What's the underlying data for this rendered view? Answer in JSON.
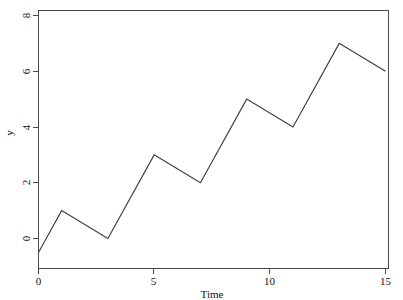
{
  "chart_data": {
    "type": "line",
    "title": "",
    "xlabel": "Time",
    "ylabel": "y",
    "xlim": [
      -0.25,
      15.2
    ],
    "ylim": [
      -0.72,
      8.3
    ],
    "grid": false,
    "legend": "none",
    "x": [
      0,
      1,
      2,
      3,
      4,
      5,
      6,
      7,
      8,
      9,
      10,
      11,
      12,
      13,
      14,
      15
    ],
    "values": [
      -0.5,
      1,
      0.5,
      0,
      1.5,
      3,
      2.5,
      2,
      3.5,
      5,
      4.5,
      4,
      5.5,
      7,
      6.5,
      6
    ],
    "series": [
      {
        "name": "y",
        "values": [
          -0.5,
          1,
          0.5,
          0,
          1.5,
          3,
          2.5,
          2,
          3.5,
          5,
          4.5,
          4,
          5.5,
          7,
          6.5,
          6
        ]
      }
    ],
    "vertices": [
      {
        "x": 0,
        "y": -0.5
      },
      {
        "x": 1,
        "y": 1
      },
      {
        "x": 3,
        "y": 0
      },
      {
        "x": 5,
        "y": 3
      },
      {
        "x": 7,
        "y": 2
      },
      {
        "x": 9,
        "y": 5
      },
      {
        "x": 11,
        "y": 4
      },
      {
        "x": 13,
        "y": 7
      },
      {
        "x": 15,
        "y": 6
      }
    ],
    "xticks": [
      0,
      5,
      10,
      15
    ],
    "xtick_labels": [
      "0",
      "5",
      "10",
      "15"
    ],
    "yticks": [
      0,
      2,
      4,
      6,
      8
    ],
    "ytick_labels": [
      "0",
      "2",
      "4",
      "6",
      "8"
    ],
    "line_color": "#3a3a3a",
    "axis_color": "#4a4a4a",
    "background": "#ffffff"
  },
  "axes": {
    "x_title": "Time",
    "y_title": "y",
    "x_tick_labels": [
      "0",
      "5",
      "10",
      "15"
    ],
    "y_tick_labels": [
      "0",
      "2",
      "4",
      "6",
      "8"
    ]
  }
}
